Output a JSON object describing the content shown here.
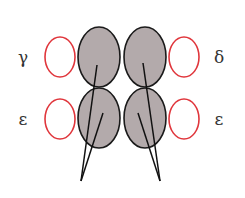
{
  "diagram": {
    "labels": {
      "top_left": "γ",
      "bottom_left": "ε",
      "top_right": "δ",
      "bottom_right": "ε"
    },
    "colors": {
      "subunit_fill": "#b3aaab",
      "subunit_stroke": "#1a1a1a",
      "outline_red": "#e0363c",
      "line": "#111111"
    }
  }
}
